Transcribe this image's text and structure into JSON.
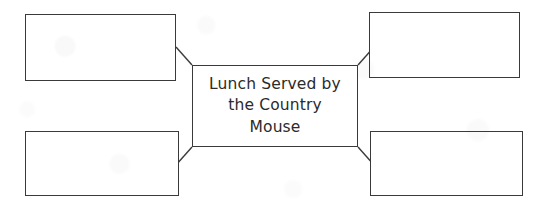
{
  "canvas": {
    "width": 543,
    "height": 210,
    "background_color": "#ffffff",
    "stroke_color": "#3a3a3a",
    "text_color": "#2b2b2b"
  },
  "diagram": {
    "type": "graphic-organizer",
    "center": {
      "label": "Lunch Served by\nthe Country\nMouse",
      "lines": [
        "Lunch Served by",
        "the Country",
        "Mouse"
      ],
      "x": 192,
      "y": 65,
      "width": 166,
      "height": 82
    },
    "boxes": [
      {
        "id": "top-left",
        "label": "",
        "x": 25,
        "y": 14,
        "width": 151,
        "height": 67
      },
      {
        "id": "top-right",
        "label": "",
        "x": 369,
        "y": 12,
        "width": 151,
        "height": 66
      },
      {
        "id": "bottom-left",
        "label": "",
        "x": 25,
        "y": 131,
        "width": 154,
        "height": 65
      },
      {
        "id": "bottom-right",
        "label": "",
        "x": 370,
        "y": 131,
        "width": 153,
        "height": 65
      }
    ],
    "connectors": [
      {
        "id": "center-to-top-left",
        "from": [
          192,
          65
        ],
        "to": [
          176,
          47
        ]
      },
      {
        "id": "center-to-top-right",
        "from": [
          358,
          65
        ],
        "to": [
          374,
          47
        ]
      },
      {
        "id": "center-to-bottom-left",
        "from": [
          192,
          147
        ],
        "to": [
          176,
          165
        ]
      },
      {
        "id": "center-to-bottom-right",
        "from": [
          358,
          147
        ],
        "to": [
          374,
          165
        ]
      }
    ]
  }
}
